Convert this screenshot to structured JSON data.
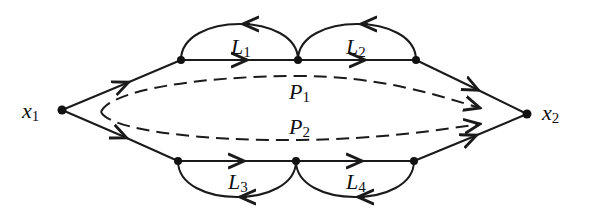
{
  "diagram": {
    "type": "signal-flow-graph",
    "nodes": [
      {
        "id": "x1",
        "label": "x",
        "subscript": "1"
      },
      {
        "id": "x2",
        "label": "x",
        "subscript": "2"
      }
    ],
    "loops": [
      {
        "id": "L1",
        "label": "L",
        "subscript": "1"
      },
      {
        "id": "L2",
        "label": "L",
        "subscript": "2"
      },
      {
        "id": "L3",
        "label": "L",
        "subscript": "3"
      },
      {
        "id": "L4",
        "label": "L",
        "subscript": "4"
      }
    ],
    "paths": [
      {
        "id": "P1",
        "label": "P",
        "subscript": "1",
        "style": "dashed"
      },
      {
        "id": "P2",
        "label": "P",
        "subscript": "2",
        "style": "dashed"
      }
    ],
    "colors": {
      "ink": "#111111",
      "background": "#ffffff"
    }
  }
}
